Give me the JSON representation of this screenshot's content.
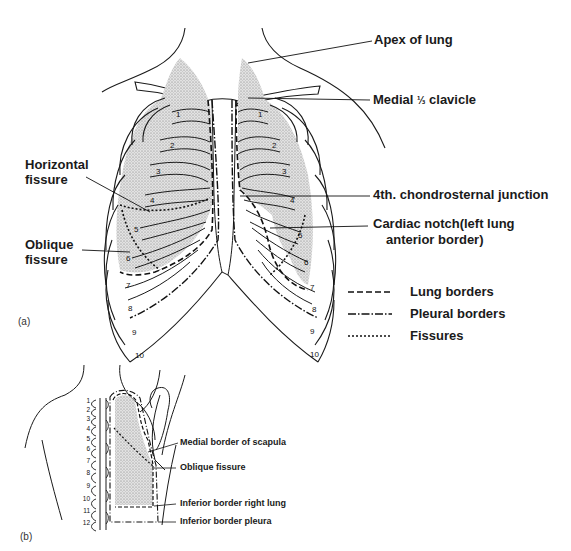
{
  "panel_a": {
    "tag": "(a)",
    "labels": {
      "apex": "Apex of lung",
      "clavicle_pre": "Medial ",
      "clavicle_frac": "⅓",
      "clavicle_post": " clavicle",
      "horizontal_1": "Horizontal",
      "horizontal_2": "fissure",
      "chondrosternal": "4th. chondrosternal junction",
      "cardiac_1": "Cardiac notch(left lung",
      "cardiac_2": "anterior border)",
      "oblique_1": "Oblique",
      "oblique_2": "fissure"
    },
    "rib_numbers_right": [
      "1",
      "2",
      "3",
      "4",
      "5",
      "6",
      "7",
      "8",
      "9",
      "10"
    ],
    "rib_numbers_left": [
      "1",
      "2",
      "3",
      "4",
      "5",
      "6",
      "7",
      "8",
      "9",
      "10"
    ],
    "legend": [
      {
        "style": "dashed",
        "label": "Lung borders"
      },
      {
        "style": "dash-dot",
        "label": "Pleural borders"
      },
      {
        "style": "dotted",
        "label": "Fissures"
      }
    ]
  },
  "panel_b": {
    "tag": "(b)",
    "vertebra_numbers": [
      "1",
      "2",
      "3",
      "4",
      "5",
      "6",
      "7",
      "8",
      "9",
      "10",
      "11",
      "12"
    ],
    "labels": {
      "scapula": "Medial border of scapula",
      "oblique": "Oblique fissure",
      "inferior_lung": "Inferior border right lung",
      "inferior_pleura": "Inferior border pleura"
    }
  },
  "colors": {
    "ink": "#1a1a1a",
    "lung_fill": "#d4d4d4",
    "background": "#ffffff"
  }
}
